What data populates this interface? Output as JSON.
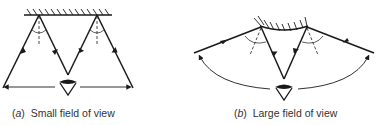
{
  "figure": {
    "panel_a": {
      "label": "(a)",
      "letter": "a",
      "caption": "Small field of view",
      "mirror_type": "flat mirror",
      "rays": [
        "incoming-left",
        "reflected-to-eye-left",
        "reflected-to-eye-right",
        "incoming-right"
      ]
    },
    "panel_b": {
      "label": "(b)",
      "letter": "b",
      "caption": "Large field of view",
      "mirror_type": "convex mirror",
      "rays": [
        "incoming-left",
        "reflected-to-eye-left",
        "reflected-to-eye-right",
        "incoming-right"
      ]
    },
    "colors": {
      "line": "#1a1a1a",
      "background": "#ffffff"
    }
  }
}
